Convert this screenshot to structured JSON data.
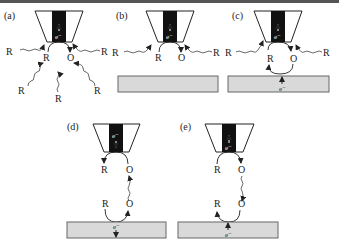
{
  "figure": {
    "panels": [
      {
        "label": "(a)",
        "electron": "e⁻",
        "species": {
          "reduced": "R",
          "oxidized": "O"
        },
        "diffusing": [
          "R",
          "R",
          "R",
          "R",
          "R"
        ],
        "substrate": false
      },
      {
        "label": "(b)",
        "electron": "e⁻",
        "species": {
          "reduced": "R",
          "oxidized": "O"
        },
        "diffusing": [
          "R",
          "R"
        ],
        "substrate": true
      },
      {
        "label": "(c)",
        "electron": "e⁻",
        "substrate_electron": "e⁻",
        "species": {
          "reduced": "R",
          "oxidized": "O"
        },
        "diffusing": [
          "R",
          "R"
        ],
        "substrate": true
      },
      {
        "label": "(d)",
        "electron": "e⁻",
        "substrate_electron": "e⁻",
        "tip_species": {
          "reduced": "R",
          "oxidized": "O"
        },
        "substrate_species": {
          "reduced": "R",
          "oxidized": "O"
        },
        "substrate": true
      },
      {
        "label": "(e)",
        "electron": "e⁻",
        "substrate_electron": "e⁻",
        "tip_species": {
          "reduced": "R",
          "oxidized": "O"
        },
        "substrate_species": {
          "reduced": "R",
          "oxidized": "O"
        },
        "substrate": true
      }
    ]
  }
}
